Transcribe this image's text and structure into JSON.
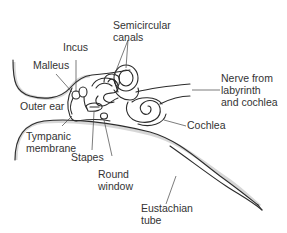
{
  "diagram": {
    "labels": {
      "semicircular_canals_1": "Semicircular",
      "semicircular_canals_2": "canals",
      "incus": "Incus",
      "malleus": "Malleus",
      "outer_ear": "Outer ear",
      "tympanic_membrane_1": "Tympanic",
      "tympanic_membrane_2": "membrane",
      "stapes": "Stapes",
      "round_window_1": "Round",
      "round_window_2": "window",
      "nerve_1": "Nerve from",
      "nerve_2": "labyrinth",
      "nerve_3": "and cochlea",
      "cochlea": "Cochlea",
      "eustachian_tube_1": "Eustachian",
      "eustachian_tube_2": "tube"
    },
    "colors": {
      "line": "#2b2b2b",
      "text": "#333333",
      "background": "#ffffff"
    }
  }
}
